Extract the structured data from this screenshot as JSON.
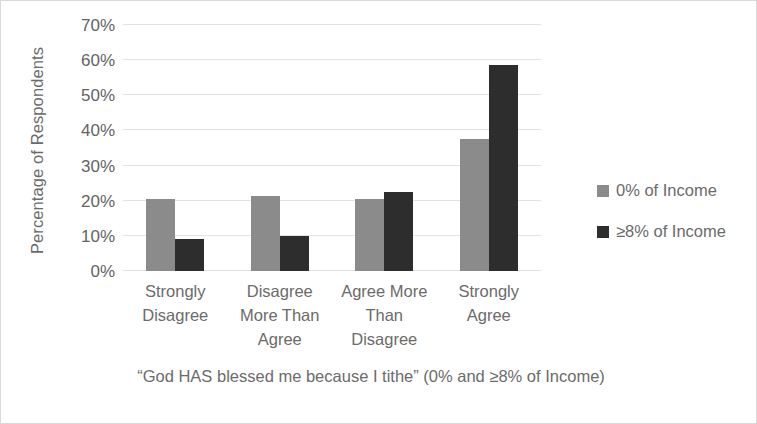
{
  "chart_data": {
    "type": "bar",
    "title": "",
    "xlabel": "“God HAS blessed me because I tithe” (0% and ≥8% of Income)",
    "ylabel": "Percentage of Respondents",
    "categories": [
      "Strongly Disagree",
      "Disagree More Than Agree",
      "Agree More Than Disagree",
      "Strongly Agree"
    ],
    "category_lines": [
      [
        "Strongly",
        "Disagree"
      ],
      [
        "Disagree",
        "More Than",
        "Agree"
      ],
      [
        "Agree More",
        "Than",
        "Disagree"
      ],
      [
        "Strongly",
        "Agree"
      ]
    ],
    "series": [
      {
        "name": "0% of Income",
        "color": "#8b8b8b",
        "values": [
          20.5,
          21.3,
          20.5,
          37.7
        ]
      },
      {
        "name": "≥8% of Income",
        "color": "#2d2d2d",
        "values": [
          9.0,
          10.0,
          22.5,
          58.7
        ]
      }
    ],
    "ylim": [
      0,
      70
    ],
    "ytick_values": [
      0,
      10,
      20,
      30,
      40,
      50,
      60,
      70
    ],
    "ytick_labels": [
      "0%",
      "10%",
      "20%",
      "30%",
      "40%",
      "50%",
      "60%",
      "70%"
    ],
    "grid": true,
    "grid_color": "#e2e2e2",
    "legend_position": "right",
    "value_format": "percent"
  },
  "legend": {
    "items": [
      {
        "label": "0% of Income",
        "color": "#8b8b8b"
      },
      {
        "label": "≥8% of Income",
        "color": "#2d2d2d"
      }
    ]
  },
  "axes": {
    "y_title": "Percentage of Respondents",
    "x_title": "“God HAS blessed me because I tithe” (0% and ≥8% of Income)"
  },
  "colors": {
    "series_0": "#8b8b8b",
    "series_1": "#2d2d2d",
    "gridline": "#e2e2e2",
    "text": "#6b6b6b",
    "background": "#ffffff"
  }
}
